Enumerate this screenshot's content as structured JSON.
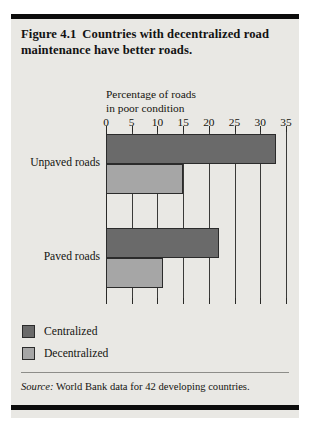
{
  "figure": {
    "number": "Figure 4.1",
    "title": "Countries with decentralized road maintenance have better roads.",
    "source_word": "Source:",
    "source_text": " World Bank data for 42 developing countries."
  },
  "legend": {
    "items": [
      {
        "label": "Centralized",
        "color": "#6a6a6a",
        "swatch": "centralized"
      },
      {
        "label": "Decentralized",
        "color": "#a6a6a6",
        "swatch": "decentralized"
      }
    ]
  },
  "colors": {
    "panel_background": "#e9e8e4",
    "rule": "#0c0c0c",
    "centralized": "#6a6a6a",
    "decentralized": "#a6a6a6",
    "axis": "#2a2a28",
    "grid": "#3a3a38"
  },
  "chart_data": {
    "type": "bar",
    "orientation": "horizontal",
    "xlabel": "Percentage of roads in poor condition",
    "xlabel_line1": "Percentage of roads",
    "xlabel_line2": "in poor condition",
    "ylabel": "",
    "categories": [
      "Unpaved roads",
      "Paved roads"
    ],
    "series": [
      {
        "name": "Centralized",
        "values": [
          33,
          22
        ],
        "color": "#6a6a6a"
      },
      {
        "name": "Decentralized",
        "values": [
          15,
          11
        ],
        "color": "#a6a6a6"
      }
    ],
    "xlim": [
      0,
      35
    ],
    "xticks": [
      0,
      5,
      10,
      15,
      20,
      25,
      30,
      35
    ],
    "xtick_labels": [
      "0",
      "5",
      "10",
      "15",
      "20",
      "25",
      "30",
      "35"
    ],
    "grid": true,
    "grid_axis": "x",
    "legend_position": "below-left",
    "annotations": [],
    "source": "Source: World Bank data for 42 developing countries."
  }
}
